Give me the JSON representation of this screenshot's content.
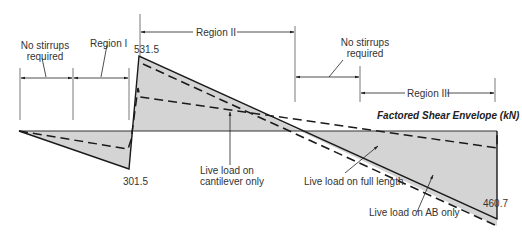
{
  "diagram": {
    "title": "Factored Shear Envelope (kN)",
    "values": {
      "peak_positive": "531.5",
      "left_negative": "301.5",
      "right_negative": "460.7"
    },
    "region_labels": {
      "no_stirrups_left_line1": "No stirrups",
      "no_stirrups_left_line2": "required",
      "region_1": "Region I",
      "region_2": "Region II",
      "no_stirrups_right_line1": "No stirrups",
      "no_stirrups_right_line2": "required",
      "region_3": "Region III"
    },
    "curve_labels": {
      "cantilever_line1": "Live load on",
      "cantilever_line2": "cantilever only",
      "full_length": "Live load on full length",
      "ab_only": "Live load on AB only"
    },
    "colors": {
      "fill": "#d4d4d4",
      "line": "#1a1a1a",
      "text": "#333333"
    }
  }
}
